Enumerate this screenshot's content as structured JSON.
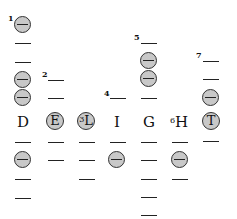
{
  "diagram": {
    "colors": {
      "circle_fill": "#c8c8c8",
      "stroke": "#222222",
      "background": "#ffffff"
    },
    "letter_row_y": 120,
    "columns": [
      {
        "letter": "D",
        "circled": false,
        "number": "1",
        "x": 23,
        "above": [
          "circle",
          "dash",
          "dash",
          "circle",
          "circle"
        ],
        "below": [
          "dash",
          "circle",
          "dash",
          "dash"
        ]
      },
      {
        "letter": "E",
        "circled": true,
        "number": "2",
        "x": 55,
        "above": [
          "dash",
          "dash"
        ],
        "below": [
          "dash",
          "dash"
        ]
      },
      {
        "letter": "L",
        "circled": true,
        "number": "3",
        "x": 87,
        "above": [],
        "below": [
          "dash",
          "dash",
          "dash"
        ]
      },
      {
        "letter": "I",
        "circled": false,
        "number": "4",
        "x": 117,
        "above": [
          "dash"
        ],
        "below": [
          "dash",
          "circle"
        ]
      },
      {
        "letter": "G",
        "circled": false,
        "number": "5",
        "x": 149,
        "above": [
          "dash",
          "circle",
          "circle",
          "dash"
        ],
        "below": [
          "dash",
          "dash",
          "dash",
          "dash",
          "dash"
        ]
      },
      {
        "letter": "H",
        "circled": false,
        "number": "6",
        "x": 180,
        "above": [],
        "below": [
          "dash",
          "circle",
          "dash"
        ]
      },
      {
        "letter": "T",
        "circled": true,
        "number": "7",
        "x": 211,
        "above": [
          "dash",
          "dash",
          "circle"
        ],
        "below": [
          "dash"
        ]
      }
    ],
    "labels": {
      "D": "D",
      "E": "E",
      "L": "L",
      "I": "I",
      "G": "G",
      "H": "H",
      "T": "T",
      "n1": "1",
      "n2": "2",
      "n3": "3",
      "n4": "4",
      "n5": "5",
      "n6": "6",
      "n7": "7"
    }
  }
}
